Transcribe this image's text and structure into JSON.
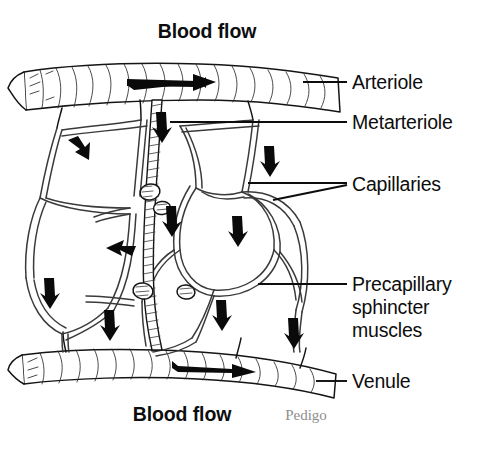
{
  "figure": {
    "background_color": "#ffffff",
    "ink_color": "#0d0d0d",
    "signature": "Pedigo",
    "signature_color": "#8e8e8e"
  },
  "captions": {
    "top_flow": "Blood flow",
    "bottom_flow": "Blood flow"
  },
  "labels": [
    {
      "id": "arteriole",
      "text": "Arteriole",
      "x": 352,
      "y": 88
    },
    {
      "id": "metarteriole",
      "text": "Metarteriole",
      "x": 352,
      "y": 128
    },
    {
      "id": "capillaries",
      "text": "Capillaries",
      "x": 352,
      "y": 190
    },
    {
      "id": "precapillary-sphincter",
      "lines": [
        "Precapillary",
        "sphincter",
        "muscles"
      ],
      "x": 352,
      "y": 290
    },
    {
      "id": "venule",
      "text": "Venule",
      "x": 352,
      "y": 386
    }
  ],
  "structures": [
    {
      "id": "arteriole",
      "name": "Arteriole",
      "orientation": "horizontal",
      "position": "top"
    },
    {
      "id": "venule",
      "name": "Venule",
      "orientation": "horizontal",
      "position": "bottom"
    },
    {
      "id": "metarteriole",
      "name": "Metarteriole",
      "orientation": "vertical",
      "position": "center"
    },
    {
      "id": "capillaries",
      "name": "Capillaries",
      "count": 12
    },
    {
      "id": "sphincters",
      "name": "Precapillary sphincter muscles",
      "count": 4
    }
  ],
  "flow_arrows": {
    "count": 11,
    "direction_top": "right",
    "direction_bottom": "right",
    "network_direction": "downward"
  }
}
